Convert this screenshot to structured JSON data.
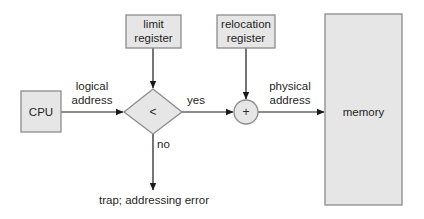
{
  "diagram": {
    "colors": {
      "node_fill": "#e6e6e6",
      "node_border": "#8c8c8c",
      "edge": "#1a1a1a",
      "text": "#1f1f1f",
      "background": "#ffffff"
    },
    "nodes": {
      "cpu": {
        "label": "CPU"
      },
      "limit_register": {
        "line1": "limit",
        "line2": "register"
      },
      "relocation_register": {
        "line1": "relocation",
        "line2": "register"
      },
      "comparator": {
        "symbol": "<"
      },
      "adder": {
        "symbol": "+"
      },
      "memory": {
        "label": "memory"
      },
      "trap": {
        "label": "trap; addressing error"
      }
    },
    "edges": {
      "cpu_to_comparator": {
        "line1": "logical",
        "line2": "address"
      },
      "comparator_to_adder": {
        "label": "yes"
      },
      "comparator_to_trap": {
        "label": "no"
      },
      "adder_to_memory": {
        "line1": "physical",
        "line2": "address"
      },
      "limit_to_comparator": {
        "label": ""
      },
      "relocation_to_adder": {
        "label": ""
      }
    }
  }
}
